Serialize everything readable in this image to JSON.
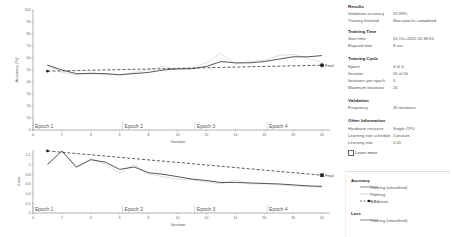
{
  "accuracy_chart": {
    "ylabel": "Accuracy (%)",
    "xlabel": "Iteration",
    "yticks": [
      "0",
      "10",
      "20",
      "30",
      "40",
      "50",
      "60",
      "70",
      "80",
      "90",
      "100"
    ],
    "xticks": [
      "0",
      "2",
      "4",
      "6",
      "8",
      "10",
      "12",
      "14",
      "16",
      "18",
      "20"
    ],
    "epochs": [
      "Epoch 1",
      "Epoch 2",
      "Epoch 3",
      "Epoch 4"
    ],
    "final_label": "Final"
  },
  "loss_chart": {
    "ylabel": "Loss",
    "xlabel": "Iteration",
    "yticks": [
      "0",
      "0.2",
      "0.4",
      "0.6",
      "0.8",
      "1",
      "1.2"
    ],
    "xticks": [
      "0",
      "2",
      "4",
      "6",
      "8",
      "10",
      "12",
      "14",
      "16",
      "18",
      "20"
    ],
    "epochs": [
      "Epoch 1",
      "Epoch 2",
      "Epoch 3",
      "Epoch 4"
    ],
    "final_label": "Final"
  },
  "chart_data": [
    {
      "type": "line",
      "title": "Accuracy",
      "xlabel": "Iteration",
      "ylabel": "Accuracy (%)",
      "xlim": [
        0,
        21
      ],
      "ylim": [
        0,
        100
      ],
      "grid": false,
      "x": [
        1,
        2,
        3,
        4,
        5,
        6,
        7,
        8,
        9,
        10,
        11,
        12,
        13,
        14,
        15,
        16,
        17,
        18,
        19,
        20
      ],
      "series": [
        {
          "name": "Training (smoothed)",
          "values": [
            54,
            50,
            47,
            47,
            47,
            46,
            47,
            48,
            50,
            51,
            51,
            53,
            57,
            56,
            56,
            57,
            59,
            61,
            61,
            62
          ]
        },
        {
          "name": "Training",
          "values": [
            54,
            48,
            46,
            48,
            46,
            46,
            48,
            50,
            53,
            50,
            52,
            56,
            64,
            55,
            57,
            58,
            62,
            63,
            60,
            56
          ]
        },
        {
          "name": "Validation",
          "x": [
            1,
            20
          ],
          "values": [
            49,
            53.99
          ]
        }
      ],
      "annotations": [
        "Epoch 1",
        "Epoch 2",
        "Epoch 3",
        "Epoch 4",
        "Final"
      ]
    },
    {
      "type": "line",
      "title": "Loss",
      "xlabel": "Iteration",
      "ylabel": "Loss",
      "xlim": [
        0,
        21
      ],
      "ylim": [
        0,
        1.3
      ],
      "grid": false,
      "x": [
        1,
        2,
        3,
        4,
        5,
        6,
        7,
        8,
        9,
        10,
        11,
        12,
        13,
        14,
        15,
        16,
        17,
        18,
        19,
        20
      ],
      "series": [
        {
          "name": "Training (smoothed)",
          "values": [
            1.0,
            1.28,
            0.95,
            1.1,
            1.05,
            0.9,
            0.95,
            0.83,
            0.8,
            0.75,
            0.7,
            0.67,
            0.63,
            0.63,
            0.62,
            0.61,
            0.6,
            0.58,
            0.56,
            0.55
          ]
        },
        {
          "name": "Training",
          "values": [
            1.0,
            1.28,
            0.92,
            1.12,
            1.0,
            0.82,
            1.0,
            0.8,
            0.75,
            0.7,
            0.68,
            0.65,
            0.6,
            0.68,
            0.6,
            0.6,
            0.58,
            0.56,
            0.55,
            0.53
          ]
        },
        {
          "name": "Validation",
          "x": [
            1,
            20
          ],
          "values": [
            1.28,
            0.78
          ]
        }
      ],
      "annotations": [
        "Epoch 1",
        "Epoch 2",
        "Epoch 3",
        "Epoch 4",
        "Final"
      ]
    }
  ],
  "panel": {
    "results": {
      "title": "Results",
      "rows": [
        {
          "label": "Validation accuracy",
          "value": "53.99%"
        },
        {
          "label": "Training finished",
          "value": "Max epochs completed"
        }
      ]
    },
    "training_time": {
      "title": "Training Time",
      "rows": [
        {
          "label": "Start time",
          "value": "01-Oct-2022 02:38:55"
        },
        {
          "label": "Elapsed time",
          "value": "8 sec"
        }
      ]
    },
    "training_cycle": {
      "title": "Training Cycle",
      "rows": [
        {
          "label": "Epoch",
          "value": "4 of 4"
        },
        {
          "label": "Iteration",
          "value": "20 of 20"
        },
        {
          "label": "Iterations per epoch",
          "value": "5"
        },
        {
          "label": "Maximum iterations",
          "value": "20"
        }
      ]
    },
    "validation": {
      "title": "Validation",
      "rows": [
        {
          "label": "Frequency",
          "value": "30 iterations"
        }
      ]
    },
    "other": {
      "title": "Other Information",
      "rows": [
        {
          "label": "Hardware resource",
          "value": "Single CPU"
        },
        {
          "label": "Learning rate schedule",
          "value": "Constant"
        },
        {
          "label": "Learning rate",
          "value": "0.01"
        }
      ]
    },
    "learn_more": "Learn more",
    "legend": {
      "accuracy_title": "Accuracy",
      "accuracy_items": [
        "Training (smoothed)",
        "Training",
        "Validation"
      ],
      "loss_title": "Loss",
      "loss_items": [
        "Training (smoothed)"
      ]
    }
  },
  "colors": {
    "smoothed": "#444444",
    "training": "#bbbbbb",
    "validation": "#222222",
    "axis": "#555555",
    "epoch_label": "#555555"
  }
}
